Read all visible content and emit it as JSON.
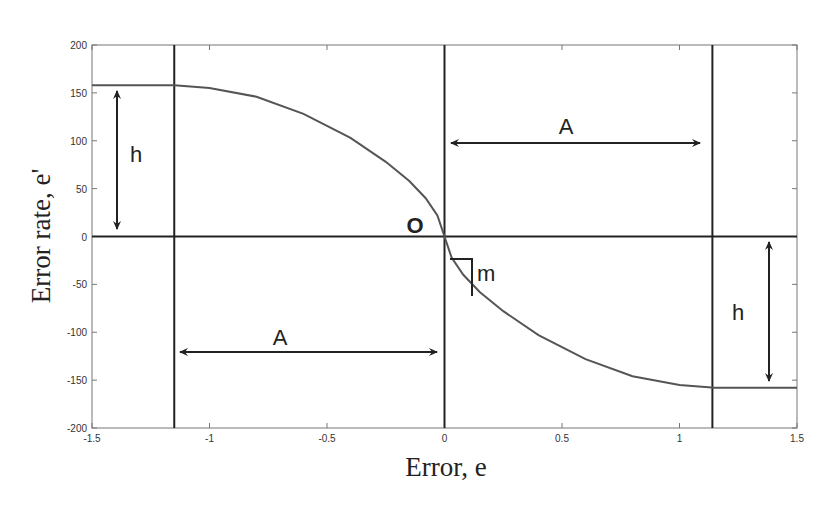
{
  "chart_data": {
    "type": "line",
    "title": "",
    "xlabel": "Error, e",
    "ylabel": "Error rate, e'",
    "xlim": [
      -1.5,
      1.5
    ],
    "ylim": [
      -200,
      200
    ],
    "xticks": [
      -1.5,
      -1,
      -0.5,
      0,
      0.5,
      1,
      1.5
    ],
    "xtick_labels": [
      "-1.5",
      "-1",
      "-0.5",
      "0",
      "0.5",
      "1",
      "1.5"
    ],
    "yticks": [
      200,
      150,
      100,
      50,
      0,
      -50,
      -100,
      -150,
      -200
    ],
    "ytick_labels": [
      "200",
      "150",
      "100",
      "50",
      "0",
      "-50",
      "-100",
      "-150",
      "-200"
    ],
    "grid": false,
    "legend": null,
    "series": [
      {
        "name": "switching curve",
        "x": [
          -1.5,
          -1.15,
          -1.0,
          -0.8,
          -0.6,
          -0.4,
          -0.25,
          -0.15,
          -0.08,
          -0.03,
          0,
          0.03,
          0.08,
          0.15,
          0.25,
          0.4,
          0.6,
          0.8,
          1.0,
          1.15,
          1.5
        ],
        "y": [
          158,
          158,
          155,
          146,
          128,
          103,
          78,
          58,
          40,
          22,
          0,
          -22,
          -40,
          -58,
          -78,
          -103,
          -128,
          -146,
          -155,
          -158,
          -158
        ]
      }
    ],
    "reference_lines": {
      "vertical": [
        -1.15,
        0,
        1.14
      ],
      "horizontal": [
        0
      ]
    },
    "annotations": [
      {
        "text": "h",
        "type": "double-arrow-vertical",
        "x": -1.39,
        "y_from": 0,
        "y_to": 158
      },
      {
        "text": "A",
        "type": "double-arrow-horizontal",
        "y": 95,
        "x_from": 0,
        "x_to": 1.08
      },
      {
        "text": "A",
        "type": "double-arrow-horizontal",
        "y": -123,
        "x_from": -1.12,
        "x_to": -0.02
      },
      {
        "text": "h",
        "type": "double-arrow-vertical",
        "x": 1.39,
        "y_from": 0,
        "y_to": -158
      },
      {
        "text": "O",
        "type": "label",
        "x": -0.1,
        "y": 8
      },
      {
        "text": "m",
        "type": "slope-triangle",
        "x": 0.12,
        "y": -45
      }
    ]
  },
  "labels": {
    "xlabel": "Error, e",
    "ylabel": "Error rate, e'",
    "h_left": "h",
    "h_right": "h",
    "a_top": "A",
    "a_bottom": "A",
    "origin": "O",
    "slope": "m"
  }
}
